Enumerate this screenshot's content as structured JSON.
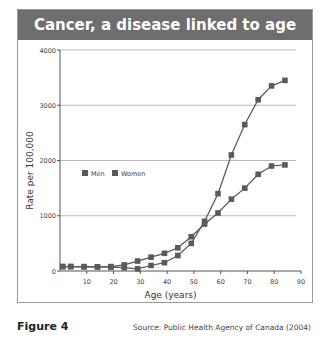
{
  "title": "Cancer, a disease linked to age",
  "figure_label": "Figure 4",
  "source": "Source: Public Health Agency of Canada (2004)",
  "colors": {
    "title_bg": "#6e6e6e",
    "series": "#555555",
    "grid": "#bbbbbb"
  },
  "chart_data": {
    "type": "line",
    "title": "Cancer, a disease linked to age",
    "xlabel": "Age (years)",
    "ylabel": "Rate per 100,000",
    "xlim": [
      0,
      90
    ],
    "ylim": [
      0,
      4000
    ],
    "xticks": [
      10,
      20,
      30,
      40,
      50,
      60,
      70,
      80,
      90
    ],
    "yticks": [
      0,
      1000,
      2000,
      3000,
      4000
    ],
    "grid": "horizontal",
    "legend": {
      "position": "upper-left inside",
      "entries": [
        "Men",
        "Women"
      ]
    },
    "x": [
      1,
      4,
      9,
      14,
      19,
      24,
      29,
      34,
      39,
      44,
      49,
      54,
      59,
      64,
      69,
      74,
      79,
      84
    ],
    "series": [
      {
        "name": "Men",
        "values": [
          80,
          80,
          80,
          75,
          70,
          60,
          40,
          100,
          150,
          280,
          500,
          900,
          1400,
          2100,
          2650,
          3100,
          3350,
          3450
        ]
      },
      {
        "name": "Women",
        "values": [
          80,
          80,
          75,
          75,
          80,
          110,
          180,
          250,
          320,
          420,
          620,
          850,
          1050,
          1300,
          1500,
          1750,
          1900,
          1920
        ]
      }
    ]
  }
}
